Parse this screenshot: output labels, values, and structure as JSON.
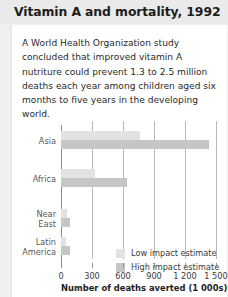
{
  "header": {
    "title": "Vitamin A and mortality, 1992"
  },
  "body": {
    "paragraph": "A World Health Organization study concluded that improved vitamin A nutriture could prevent 1.3 to 2.5 million deaths each year among children aged six months to five years in the developing world."
  },
  "chart_data": {
    "type": "bar",
    "orientation": "horizontal",
    "title": "Vitamin A and mortality, 1992",
    "categories": [
      "Asia",
      "Near\nEast",
      "Africa",
      "Latin\nAmerica"
    ],
    "category_order": [
      "Asia",
      "Africa",
      "Near East",
      "Latin America"
    ],
    "series": [
      {
        "name": "Low impact estimate",
        "values": [
          760,
          330,
          55,
          50
        ]
      },
      {
        "name": "High impact estimate",
        "values": [
          1430,
          640,
          90,
          90
        ]
      }
    ],
    "bars": [
      {
        "category": "Asia",
        "label": "Asia",
        "low": 760,
        "high": 1430
      },
      {
        "category": "Africa",
        "label": "Africa",
        "low": 330,
        "high": 640
      },
      {
        "category": "Near East",
        "label": "Near\nEast",
        "low": 55,
        "high": 90
      },
      {
        "category": "Latin America",
        "label": "Latin\nAmerica",
        "low": 50,
        "high": 90
      }
    ],
    "xlabel": "Number of deaths averted (1 000s)",
    "ylabel": "",
    "xlim": [
      0,
      1500
    ],
    "xticks": [
      0,
      300,
      600,
      900,
      1200,
      1500
    ],
    "xtick_labels": [
      "0",
      "300",
      "600",
      "900",
      "1 200",
      "1 500"
    ],
    "grid": true,
    "legend_position": "inside-lower-right",
    "legend": [
      "Low impact estimate",
      "High impact estimate"
    ],
    "colors": {
      "low": "#e2e2e2",
      "high": "#c6c6c6",
      "axis": "#8f8f8f",
      "grid": "#b9b9b9",
      "text": "#3a3a3a",
      "card": "#ffffff",
      "page_background": "#efefef",
      "header_band": "#eaeaea"
    }
  }
}
